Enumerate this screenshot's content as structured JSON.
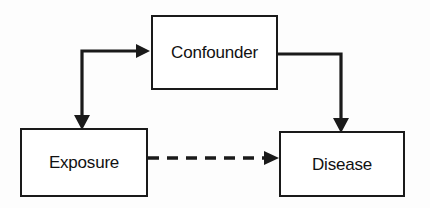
{
  "diagram": {
    "background_color": "#fdfdfd",
    "line_color": "#1a1a1a",
    "box_fill": "#ffffff",
    "nodes": [
      {
        "id": "confounder",
        "label": "Confounder"
      },
      {
        "id": "exposure",
        "label": "Exposure"
      },
      {
        "id": "disease",
        "label": "Disease"
      }
    ],
    "edges": [
      {
        "id": "confounder-to-exposure",
        "from": "Confounder",
        "to": "Exposure",
        "style": "solid",
        "arrow": "single",
        "shape": "elbow"
      },
      {
        "id": "confounder-to-disease",
        "from": "Confounder",
        "to": "Disease",
        "style": "solid",
        "arrow": "single",
        "shape": "elbow"
      },
      {
        "id": "exposure-to-disease",
        "from": "Exposure",
        "to": "Disease",
        "style": "dashed",
        "arrow": "single",
        "shape": "straight"
      }
    ]
  }
}
